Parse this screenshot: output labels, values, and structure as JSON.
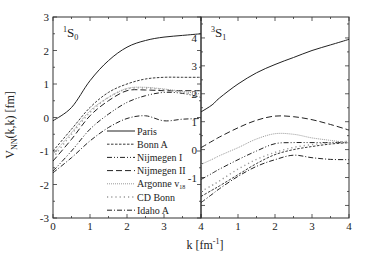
{
  "chart_data": {
    "type": "line",
    "title": "",
    "xlabel": "k [fm^-1]",
    "xlabel_parts": {
      "main": "k [fm",
      "sup": "-1",
      "end": "]"
    },
    "ylabel": "V_NN(k,k) [fm]",
    "ylabel_parts": {
      "main": "V",
      "sub": "NN",
      "end": "(k,k) [fm]"
    },
    "grid": false,
    "legend_position": "inside lower-right of left panel",
    "panels": [
      {
        "name": "1S0",
        "label": {
          "sup": "1",
          "main": "S",
          "sub": "0"
        },
        "xlim": [
          0,
          4
        ],
        "ylim": [
          -3,
          3
        ],
        "xticks": [
          0,
          1,
          2,
          3,
          4
        ],
        "yticks": [
          -3,
          -2,
          -1,
          0,
          1,
          2,
          3
        ],
        "x": [
          0,
          0.5,
          1,
          1.5,
          2,
          2.5,
          3,
          3.5,
          4
        ],
        "series": [
          {
            "name": "Paris",
            "style": "solid",
            "values": [
              -0.1,
              0.3,
              1.1,
              1.7,
              2.1,
              2.3,
              2.4,
              2.45,
              2.5
            ]
          },
          {
            "name": "Bonn A",
            "style": "dash-short",
            "values": [
              -1.0,
              -0.35,
              0.3,
              0.75,
              1.0,
              1.15,
              1.2,
              1.2,
              1.2
            ]
          },
          {
            "name": "Nijmegen I",
            "style": "dash-dot-dot",
            "values": [
              -1.6,
              -1.0,
              -0.35,
              0.1,
              0.45,
              0.65,
              0.75,
              0.72,
              0.6
            ]
          },
          {
            "name": "Nijmegen II",
            "style": "dash-long",
            "values": [
              -1.3,
              -0.65,
              0.05,
              0.5,
              0.8,
              0.82,
              0.8,
              0.8,
              0.8
            ]
          },
          {
            "name": "Argonne v18",
            "style": "dotted",
            "values": [
              -1.1,
              -0.45,
              0.2,
              0.6,
              0.87,
              0.9,
              0.85,
              0.78,
              0.7
            ]
          },
          {
            "name": "CD Bonn",
            "style": "sparse-dotted",
            "values": [
              -1.2,
              -0.5,
              0.15,
              0.6,
              0.85,
              0.88,
              0.83,
              0.75,
              0.65
            ]
          },
          {
            "name": "Idaho A",
            "style": "dash-dot",
            "values": [
              -1.65,
              -1.2,
              -0.7,
              -0.3,
              -0.03,
              0.05,
              -0.1,
              -0.05,
              -0.03
            ]
          }
        ]
      },
      {
        "name": "3S1",
        "label": {
          "sup": "3",
          "main": "S",
          "sub": "1"
        },
        "xlim": [
          0,
          4
        ],
        "ylim": [
          -2.45,
          4.75
        ],
        "xticks": [
          1,
          2,
          3,
          4
        ],
        "yticks": [
          -1,
          0,
          1,
          2,
          3,
          4
        ],
        "x": [
          0,
          0.3,
          0.5,
          1,
          1.5,
          2,
          2.5,
          3,
          3.5,
          4
        ],
        "series": [
          {
            "name": "Paris",
            "style": "solid",
            "values": [
              1.35,
              1.6,
              1.85,
              2.35,
              2.75,
              3.05,
              3.3,
              3.55,
              3.75,
              3.95
            ]
          },
          {
            "name": "Bonn A",
            "style": "dash-short",
            "values": [
              -1.68,
              -1.45,
              -1.3,
              -0.9,
              -0.5,
              -0.18,
              0.0,
              0.11,
              0.2,
              0.25
            ]
          },
          {
            "name": "Nijmegen I",
            "style": "dash-dot-dot",
            "values": [
              -1.07,
              -0.85,
              -0.7,
              -0.36,
              -0.05,
              0.21,
              0.25,
              0.25,
              0.25,
              0.25
            ]
          },
          {
            "name": "Nijmegen II",
            "style": "dash-long",
            "values": [
              0.07,
              0.3,
              0.45,
              0.78,
              1.05,
              1.2,
              1.18,
              1.07,
              0.9,
              0.7
            ]
          },
          {
            "name": "Argonne v18",
            "style": "dotted",
            "values": [
              -0.53,
              -0.35,
              -0.22,
              0.07,
              0.38,
              0.57,
              0.55,
              0.42,
              0.33,
              0.25
            ]
          },
          {
            "name": "CD Bonn",
            "style": "sparse-dotted",
            "values": [
              -1.5,
              -1.28,
              -1.12,
              -0.7,
              -0.35,
              -0.1,
              0.08,
              0.18,
              0.25,
              0.3
            ]
          },
          {
            "name": "Idaho A",
            "style": "dash-dot",
            "values": [
              -1.9,
              -1.6,
              -1.4,
              -0.96,
              -0.6,
              -0.36,
              -0.2,
              -0.29,
              -0.35,
              -0.36
            ]
          }
        ]
      }
    ],
    "legend": [
      {
        "name": "Paris",
        "label": "Paris",
        "style": "solid"
      },
      {
        "name": "Bonn A",
        "label": "Bonn A",
        "style": "dash-short"
      },
      {
        "name": "Nijmegen I",
        "label": "Nijmegen I",
        "style": "dash-dot-dot"
      },
      {
        "name": "Nijmegen II",
        "label": "Nijmegen II",
        "style": "dash-long"
      },
      {
        "name": "Argonne v18",
        "label": "Argonne v",
        "sub": "18",
        "style": "dotted"
      },
      {
        "name": "CD Bonn",
        "label": "CD Bonn",
        "style": "sparse-dotted"
      },
      {
        "name": "Idaho A",
        "label": "Idaho A",
        "style": "dash-dot"
      }
    ]
  },
  "colors": {
    "axis": "#333333",
    "line_dark": "#222222",
    "line_light": "#999999",
    "background": "#ffffff"
  }
}
